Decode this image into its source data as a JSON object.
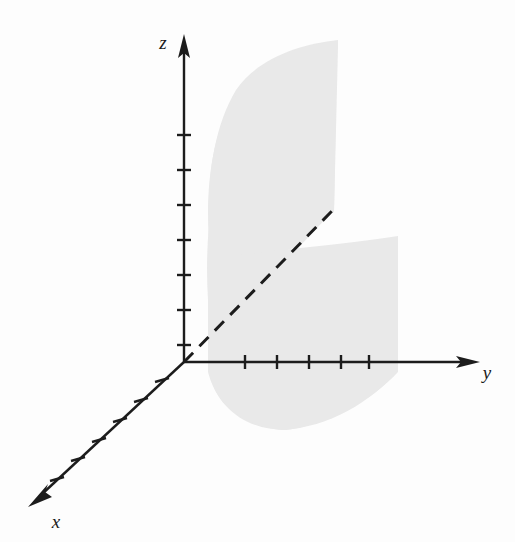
{
  "figure": {
    "type": "3d-coordinate-diagram",
    "background_color": "#fdfdfd",
    "width": 515,
    "height": 542
  },
  "axes": {
    "origin": {
      "x": 184,
      "y": 362
    },
    "stroke_color": "#1c1c1c",
    "stroke_width": 2.4,
    "tick_color": "#1c1c1c",
    "z": {
      "label": "z",
      "label_position": {
        "x": 163,
        "y": 49
      },
      "start": {
        "x": 184,
        "y": 362
      },
      "end": {
        "x": 184,
        "y": 38
      },
      "arrow": "up",
      "tick_count": 7,
      "tick_positions_y": [
        135,
        170,
        205,
        240,
        275,
        310,
        345
      ],
      "tick_half_length": 7
    },
    "y": {
      "label": "y",
      "label_position": {
        "x": 487,
        "y": 375
      },
      "start": {
        "x": 184,
        "y": 362
      },
      "end": {
        "x": 478,
        "y": 362
      },
      "arrow": "right",
      "tick_count": 5,
      "tick_positions_x": [
        245,
        277,
        309,
        341,
        369
      ],
      "tick_half_length": 7
    },
    "x": {
      "label": "x",
      "label_position": {
        "x": 52,
        "y": 524
      },
      "start": {
        "x": 184,
        "y": 362
      },
      "end": {
        "x": 30,
        "y": 505
      },
      "arrow": "down-left",
      "tick_count": 6,
      "tick_fractions": [
        0.155,
        0.295,
        0.435,
        0.575,
        0.715,
        0.855
      ],
      "tick_half_length": 7
    }
  },
  "dashed_line": {
    "name": "surface-fold-line",
    "start": {
      "x": 184,
      "y": 362
    },
    "end": {
      "x": 332,
      "y": 211
    },
    "color": "#1c1c1c",
    "width": 3,
    "dash_pattern": "13 9"
  },
  "surface": {
    "name": "shaded-surface",
    "fill_color": "#e9e9e9",
    "upper_panel": {
      "description": "Upper sail-like panel rising to an apex at top, curved left edge, straight right edge",
      "apex": {
        "x": 338,
        "y": 40
      },
      "bottom_left": {
        "x": 209,
        "y": 262
      },
      "left_edge_curve_control": {
        "x": 208,
        "y": 150
      }
    },
    "lower_panel": {
      "description": "Lower panel extending right and curving below the y-axis",
      "right_edge_x": 398,
      "bottom_y": 430,
      "left_edge_x": 209
    }
  }
}
